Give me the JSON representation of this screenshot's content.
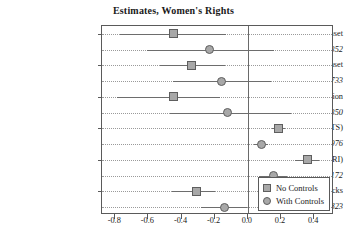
{
  "chart_data": {
    "type": "scatter",
    "title": "Estimates, Women's Rights",
    "xlabel": "",
    "ylabel": "",
    "xlim": [
      -0.88,
      0.52
    ],
    "grid": true,
    "legend_position": "bottom-right",
    "xticks": [
      -0.8,
      -0.6,
      -0.4,
      -0.2,
      0.0,
      0.2,
      0.4
    ],
    "xticklabels": [
      "-0.8",
      "-0.6",
      "-0.4",
      "-0.2",
      "0.0",
      "0.2",
      "0.4"
    ],
    "zero_reference_line": 0.0,
    "legend": [
      {
        "name": "No Controls",
        "marker": "square"
      },
      {
        "name": "With Controls",
        "marker": "circle"
      }
    ],
    "rows": [
      {
        "label": "Civil War Onset",
        "series": "No Controls",
        "marker": "square",
        "estimate": -0.45,
        "ci_low": -0.77,
        "ci_high": -0.13
      },
      {
        "label": "N = 5352",
        "series": "With Controls",
        "marker": "circle",
        "estimate": -0.23,
        "ci_low": -0.61,
        "ci_high": 0.16
      },
      {
        "label": "Civil Conflict Onset",
        "series": "No Controls",
        "marker": "square",
        "estimate": -0.34,
        "ci_low": -0.53,
        "ci_high": -0.14
      },
      {
        "label": "N = 4733",
        "series": "With Controls",
        "marker": "circle",
        "estimate": -0.16,
        "ci_low": -0.45,
        "ci_high": 0.14
      },
      {
        "label": "Int'l Dispute Initiation",
        "series": "No Controls",
        "marker": "square",
        "estimate": -0.45,
        "ci_low": -0.79,
        "ci_high": -0.17
      },
      {
        "label": "N = 5350",
        "series": "With Controls",
        "marker": "circle",
        "estimate": -0.12,
        "ci_low": -0.47,
        "ci_high": 0.26
      },
      {
        "label": "State Violence (PTS)",
        "series": "No Controls",
        "marker": "square",
        "estimate": 0.185,
        "ci_low": 0.145,
        "ci_high": 0.225
      },
      {
        "label": "N = 5976",
        "series": "With Controls",
        "marker": "circle",
        "estimate": 0.08,
        "ci_low": 0.04,
        "ci_high": 0.12
      },
      {
        "label": "State Violence (CIRI)",
        "series": "No Controls",
        "marker": "square",
        "estimate": 0.36,
        "ci_low": 0.285,
        "ci_high": 0.43
      },
      {
        "label": "N = 4172",
        "series": "With Controls",
        "marker": "circle",
        "estimate": 0.155,
        "ci_low": 0.07,
        "ci_high": 0.235
      },
      {
        "label": "Terror Attacks",
        "series": "No Controls",
        "marker": "square",
        "estimate": -0.31,
        "ci_low": -0.46,
        "ci_high": -0.2
      },
      {
        "label": "N = 3823",
        "series": "With Controls",
        "marker": "circle",
        "estimate": -0.14,
        "ci_low": -0.28,
        "ci_high": -0.005
      }
    ]
  },
  "colors": {
    "marker_fill": "#a8a8a8",
    "marker_edge": "#5e5e5e",
    "ci_line": "#6d6d6d",
    "axis": "#5a5a5a",
    "grid": "#9a9a9a",
    "background": "#ffffff",
    "text": "#1a1a1a"
  }
}
